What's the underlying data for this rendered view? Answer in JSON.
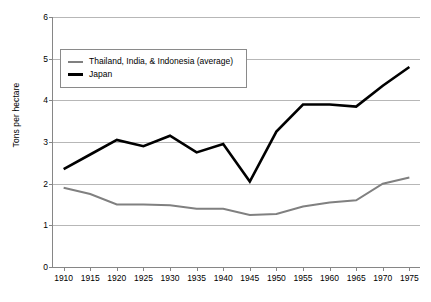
{
  "chart_data": {
    "type": "line",
    "title": "",
    "xlabel": "",
    "ylabel": "Tons per hectare",
    "xlim": [
      1908,
      1977
    ],
    "ylim": [
      0,
      6
    ],
    "yticks": [
      0,
      1,
      2,
      3,
      4,
      5,
      6
    ],
    "grid": true,
    "legend_position": "upper-left-inside",
    "x": [
      1910,
      1915,
      1920,
      1925,
      1930,
      1935,
      1940,
      1945,
      1950,
      1955,
      1960,
      1965,
      1970,
      1975
    ],
    "xtick_labels": [
      "1910",
      "1915",
      "1920",
      "1925",
      "1930",
      "1935",
      "1940",
      "1945",
      "1950",
      "1955",
      "1960",
      "1965",
      "1970",
      "1975"
    ],
    "series": [
      {
        "name": "Thailand, India, & Indonesia (average)",
        "color": "#808080",
        "values": [
          1.9,
          1.75,
          1.5,
          1.5,
          1.48,
          1.4,
          1.4,
          1.25,
          1.27,
          1.45,
          1.55,
          1.6,
          2.0,
          2.15
        ]
      },
      {
        "name": "Japan",
        "color": "#000000",
        "values": [
          2.35,
          2.7,
          3.05,
          2.9,
          3.15,
          2.75,
          2.95,
          2.05,
          3.25,
          3.9,
          3.9,
          3.85,
          4.35,
          4.8
        ]
      }
    ]
  },
  "legend": {
    "items": [
      {
        "label": "Thailand, India, & Indonesia (average)",
        "color": "#808080",
        "thickness": 2
      },
      {
        "label": "Japan",
        "color": "#000000",
        "thickness": 3
      }
    ]
  },
  "axes": {
    "y_title": "Tons per hectare"
  }
}
